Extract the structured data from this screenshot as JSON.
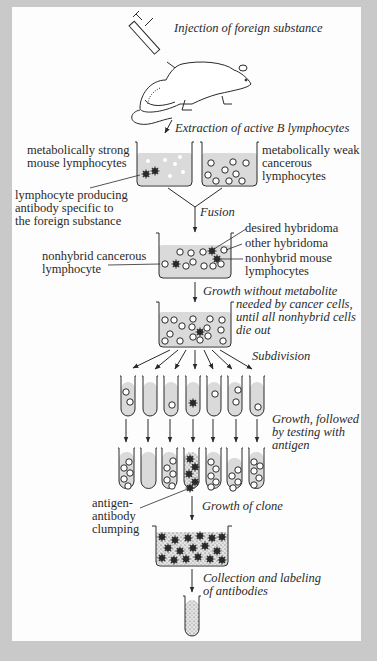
{
  "diagram": {
    "colors": {
      "frame": "#c9c9c9",
      "panel": "#fdfdfd",
      "ink": "#2a2a2a",
      "medium": "#dadada"
    },
    "steps": {
      "injection": "Injection of foreign substance",
      "extraction": "Extraction of active B lymphocytes",
      "fusion": "Fusion",
      "growth_line1": "Growth without metabolite",
      "growth_line2": "needed by cancer cells,",
      "growth_line3": "until all nonhybrid cells",
      "growth_line4": "die out",
      "subdivision": "Subdivision",
      "testing_line1": "Growth, followed",
      "testing_line2": "by testing with",
      "testing_line3": "antigen",
      "clone": "Growth of clone",
      "collection_line1": "Collection and labeling",
      "collection_line2": "of antibodies"
    },
    "labels": {
      "strong_line1": "metabolically strong",
      "strong_line2": "mouse lymphocytes",
      "weak_line1": "metabolically weak",
      "weak_line2": "cancerous",
      "weak_line3": "lymphocytes",
      "producing_line1": "lymphocyte producing",
      "producing_line2": "antibody specific to",
      "producing_line3": "the foreign substance",
      "desired_hybridoma": "desired hybridoma",
      "other_hybridoma": "other hybridoma",
      "nonhybrid_mouse_line1": "nonhybrid mouse",
      "nonhybrid_mouse_line2": "lymphocytes",
      "nonhybrid_cancer_line1": "nonhybrid cancerous",
      "nonhybrid_cancer_line2": "lymphocyte",
      "clumping_line1": "antigen-",
      "clumping_line2": "antibody",
      "clumping_line3": "clumping"
    },
    "icons": {
      "syringe": "syringe-icon",
      "mouse": "mouse-icon",
      "beaker": "beaker-icon",
      "test_tube": "test-tube-icon",
      "cell_open": "open-circle-cell",
      "cell_spiky": "spiky-dark-cell"
    }
  }
}
